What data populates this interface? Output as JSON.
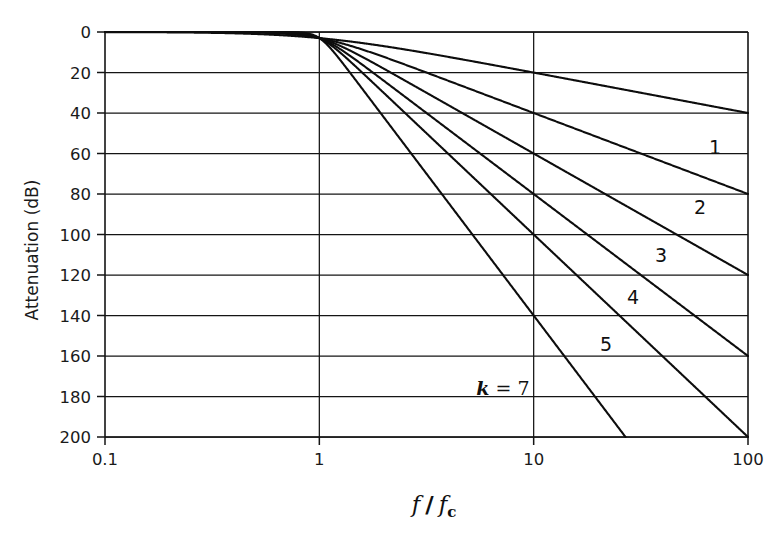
{
  "figure": {
    "name": "butterworth-lowpass-attenuation",
    "background_color": "#ffffff",
    "line_color": "#101010"
  },
  "axes": {
    "x": {
      "title_main": "f",
      "title_divider": "/",
      "title_sub_base": "f",
      "title_sub_script": "c",
      "title_plain": "f / f_c",
      "scale": "log",
      "min": 0.1,
      "max": 100,
      "ticks": [
        "0.1",
        "1",
        "10",
        "100"
      ],
      "tick_values": [
        0.1,
        1,
        10,
        100
      ]
    },
    "y": {
      "title": "Attenuation (dB)",
      "scale": "linear",
      "min": 0,
      "max": 200,
      "inverted": true,
      "ticks": [
        "0",
        "20",
        "40",
        "60",
        "80",
        "100",
        "120",
        "140",
        "160",
        "180",
        "200"
      ],
      "tick_values": [
        0,
        20,
        40,
        60,
        80,
        100,
        120,
        140,
        160,
        180,
        200
      ]
    }
  },
  "curve_labels": [
    {
      "text": "1",
      "order": 1
    },
    {
      "text": "2",
      "order": 2
    },
    {
      "text": "3",
      "order": 3
    },
    {
      "text": "4",
      "order": 4
    },
    {
      "text": "5",
      "order": 5
    },
    {
      "text": "k = 7",
      "order": 7,
      "prefix_italic": "k",
      "equals": " = ",
      "value": "7"
    }
  ],
  "chart_data": {
    "type": "line",
    "title": "",
    "subtitle": "",
    "xlabel": "f / f_c",
    "ylabel": "Attenuation (dB)",
    "xscale": "log",
    "yscale": "linear",
    "xlim": [
      0.1,
      100
    ],
    "ylim": [
      0,
      200
    ],
    "y_axis_inverted": true,
    "grid": true,
    "grid_x_values": [
      0.1,
      1,
      10,
      100
    ],
    "grid_y_values": [
      0,
      20,
      40,
      60,
      80,
      100,
      120,
      140,
      160,
      180,
      200
    ],
    "legend": "inline-curve-labels",
    "legend_position": "inline right of each curve",
    "xticks": [
      0.1,
      1,
      10,
      100
    ],
    "xticklabels": [
      "0.1",
      "1",
      "10",
      "100"
    ],
    "yticks": [
      0,
      20,
      40,
      60,
      80,
      100,
      120,
      140,
      160,
      180,
      200
    ],
    "yticklabels": [
      "0",
      "20",
      "40",
      "60",
      "80",
      "100",
      "120",
      "140",
      "160",
      "180",
      "200"
    ],
    "formula": "A(dB) = 10*log10(1 + (f/fc)^(2k))",
    "note": "Butterworth lowpass attenuation; asymptotic slope = 20*k dB per decade",
    "series": [
      {
        "name": "1",
        "k": 1,
        "slope_db_per_decade": 20,
        "x": [
          0.1,
          0.2,
          0.3,
          0.4,
          0.5,
          0.6,
          0.7,
          0.8,
          0.9,
          1,
          1.2,
          1.5,
          2,
          3,
          4,
          5,
          7,
          10,
          20,
          30,
          50,
          70,
          100
        ],
        "values": [
          0.0,
          0.2,
          0.4,
          0.6,
          1.0,
          1.5,
          2.1,
          2.9,
          3.8,
          3.0,
          4.0,
          5.1,
          7.0,
          9.9,
          12.3,
          14.1,
          17.0,
          20.0,
          26.0,
          29.5,
          34.0,
          36.9,
          40.0
        ]
      },
      {
        "name": "2",
        "k": 2,
        "slope_db_per_decade": 40,
        "x": [
          0.1,
          0.3,
          0.5,
          0.7,
          0.8,
          0.9,
          1,
          1.2,
          1.5,
          2,
          3,
          4,
          5,
          7,
          10,
          20,
          30,
          50,
          70,
          100
        ],
        "values": [
          0.0,
          0.0,
          0.3,
          1.0,
          1.7,
          2.6,
          3.0,
          5.5,
          9.0,
          12.3,
          19.1,
          24.1,
          28.0,
          34.8,
          40.0,
          52.0,
          59.1,
          68.0,
          72.9,
          80.0
        ]
      },
      {
        "name": "3",
        "k": 3,
        "slope_db_per_decade": 60,
        "x": [
          0.1,
          0.3,
          0.5,
          0.7,
          0.8,
          0.9,
          1,
          1.2,
          1.5,
          2,
          3,
          4,
          5,
          7,
          10,
          20,
          30,
          50,
          70,
          100
        ],
        "values": [
          0.0,
          0.0,
          0.1,
          0.5,
          1.1,
          2.0,
          3.0,
          6.4,
          11.4,
          18.1,
          28.6,
          36.1,
          42.0,
          50.7,
          60.0,
          78.1,
          88.6,
          102.0,
          109.4,
          120.0
        ]
      },
      {
        "name": "4",
        "k": 4,
        "slope_db_per_decade": 80,
        "x": [
          0.1,
          0.3,
          0.5,
          0.7,
          0.8,
          0.9,
          1,
          1.2,
          1.5,
          2,
          3,
          4,
          5,
          7,
          10,
          20,
          30,
          50,
          70,
          100
        ],
        "values": [
          0.0,
          0.0,
          0.0,
          0.2,
          0.7,
          1.7,
          3.0,
          8.1,
          14.1,
          24.1,
          38.2,
          48.2,
          56.0,
          67.6,
          80.0,
          104.1,
          118.2,
          136.0,
          145.9,
          160.0
        ]
      },
      {
        "name": "5",
        "k": 5,
        "slope_db_per_decade": 100,
        "x": [
          0.1,
          0.3,
          0.5,
          0.7,
          0.8,
          0.9,
          1,
          1.2,
          1.5,
          2,
          3,
          4,
          5,
          7,
          10,
          20,
          30,
          50,
          70,
          100
        ],
        "values": [
          0.0,
          0.0,
          0.0,
          0.1,
          0.4,
          1.4,
          3.0,
          9.6,
          17.6,
          30.1,
          47.7,
          60.2,
          70.0,
          84.5,
          100.0,
          130.1,
          147.7,
          170.0,
          182.4,
          200.0
        ]
      },
      {
        "name": "k = 7",
        "k": 7,
        "slope_db_per_decade": 140,
        "x": [
          0.1,
          0.3,
          0.5,
          0.7,
          0.8,
          0.9,
          1,
          1.2,
          1.5,
          2,
          3,
          4,
          5,
          7,
          10,
          15,
          20,
          28.5
        ],
        "values": [
          0.0,
          0.0,
          0.0,
          0.0,
          0.1,
          0.9,
          3.0,
          11.4,
          24.6,
          42.1,
          66.8,
          84.3,
          98.0,
          118.3,
          140.0,
          164.7,
          182.1,
          200.0
        ]
      }
    ]
  }
}
